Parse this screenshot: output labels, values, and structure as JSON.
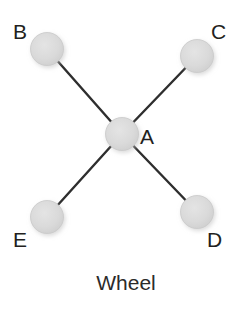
{
  "figure": {
    "caption": "Wheel",
    "background_color": "#ffffff"
  },
  "style": {
    "node_fill": "#d9d9d9",
    "node_stroke": "#c9c9c9",
    "node_shadow": "#e9e9e9",
    "edge_color": "#2e2e2e",
    "edge_width": 2.4,
    "label_color": "#231f20",
    "node_radius": 16.5
  },
  "chart_data": {
    "type": "diagram",
    "title": "Wheel",
    "graph_kind": "wheel",
    "nodes": [
      {
        "id": "A",
        "label": "A",
        "x": 122,
        "y": 134,
        "r": 16.5,
        "role": "hub",
        "label_x": 140,
        "label_y": 126
      },
      {
        "id": "B",
        "label": "B",
        "x": 47,
        "y": 49,
        "r": 16.5,
        "role": "spoke",
        "label_x": 13,
        "label_y": 21
      },
      {
        "id": "C",
        "label": "C",
        "x": 197,
        "y": 56,
        "r": 16.5,
        "role": "spoke",
        "label_x": 211,
        "label_y": 21
      },
      {
        "id": "D",
        "label": "D",
        "x": 197,
        "y": 212,
        "r": 16.5,
        "role": "spoke",
        "label_x": 207,
        "label_y": 229
      },
      {
        "id": "E",
        "label": "E",
        "x": 47,
        "y": 217,
        "r": 16.5,
        "role": "spoke",
        "label_x": 13,
        "label_y": 229
      }
    ],
    "edges": [
      {
        "source": "B",
        "target": "A"
      },
      {
        "source": "C",
        "target": "A"
      },
      {
        "source": "D",
        "target": "A"
      },
      {
        "source": "E",
        "target": "A"
      }
    ],
    "node_count": 5,
    "edge_count": 4
  }
}
